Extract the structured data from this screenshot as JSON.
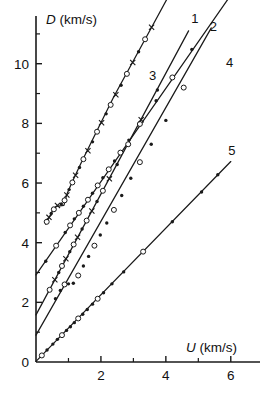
{
  "chart_data": {
    "type": "line",
    "title": "",
    "subtitle": "",
    "xlabel": "U (km/s)",
    "ylabel": "D (km/s)",
    "xlabel_symbol": "U",
    "xlabel_unit": "(km/s)",
    "ylabel_symbol": "D",
    "ylabel_unit": "(km/s)",
    "xlim": [
      0,
      6.9
    ],
    "ylim": [
      0,
      11.6
    ],
    "xticks_major": [
      0,
      2,
      4,
      6
    ],
    "xticks_major_labels": [
      "0",
      "2",
      "4",
      "6"
    ],
    "xticks_minor": [
      1,
      3,
      5
    ],
    "yticks_major": [
      0,
      2,
      4,
      6,
      8,
      10
    ],
    "yticks_major_labels": [
      "0",
      "2",
      "4",
      "6",
      "8",
      "10"
    ],
    "yticks_minor": [
      1,
      3,
      5,
      7,
      9,
      11
    ],
    "grid": false,
    "legend_position": "inline-end-of-curve",
    "marker_styles": [
      "open-circle",
      "filled-circle",
      "cross"
    ],
    "series": [
      {
        "name": "1",
        "label": "1",
        "label_x": 4.78,
        "label_y": 11.35,
        "fit_points": [
          [
            0.3,
            4.62
          ],
          [
            0.42,
            4.88
          ],
          [
            0.52,
            5.1
          ],
          [
            0.62,
            5.22
          ],
          [
            0.86,
            5.25
          ],
          [
            0.95,
            5.62
          ],
          [
            1.1,
            6.0
          ],
          [
            1.4,
            6.7
          ],
          [
            1.9,
            7.8
          ],
          [
            2.4,
            8.9
          ],
          [
            3.0,
            10.1
          ],
          [
            3.6,
            11.3
          ],
          [
            4.3,
            12.7
          ]
        ],
        "data_points": [
          [
            0.33,
            4.7
          ],
          [
            0.4,
            4.85
          ],
          [
            0.47,
            4.98
          ],
          [
            0.55,
            5.12
          ],
          [
            0.66,
            5.25
          ],
          [
            0.78,
            5.3
          ],
          [
            0.88,
            5.42
          ],
          [
            0.95,
            5.6
          ],
          [
            1.02,
            5.78
          ],
          [
            1.12,
            6.02
          ],
          [
            1.22,
            6.26
          ],
          [
            1.34,
            6.52
          ],
          [
            1.46,
            6.8
          ],
          [
            1.6,
            7.08
          ],
          [
            1.74,
            7.38
          ],
          [
            1.88,
            7.72
          ],
          [
            2.02,
            8.02
          ],
          [
            2.16,
            8.32
          ],
          [
            2.3,
            8.62
          ],
          [
            2.46,
            8.96
          ],
          [
            2.62,
            9.28
          ],
          [
            2.8,
            9.66
          ],
          [
            2.98,
            10.04
          ],
          [
            3.16,
            10.4
          ],
          [
            3.36,
            10.82
          ],
          [
            3.56,
            11.22
          ],
          [
            3.78,
            11.62
          ],
          [
            4.02,
            12.1
          ],
          [
            4.32,
            12.68
          ]
        ],
        "has_step": true,
        "step_region_x": [
          0.6,
          0.9
        ],
        "step_region_y": 5.24
      },
      {
        "name": "2",
        "label": "2",
        "label_x": 5.35,
        "label_y": 11.1,
        "fit_points": [
          [
            0.0,
            2.92
          ],
          [
            6.0,
            12.3
          ]
        ],
        "data_points": [
          [
            0.3,
            3.38
          ],
          [
            0.62,
            3.9
          ],
          [
            0.9,
            4.34
          ],
          [
            1.05,
            4.58
          ],
          [
            1.18,
            4.8
          ],
          [
            1.32,
            5.0
          ],
          [
            1.46,
            5.22
          ],
          [
            1.6,
            5.44
          ],
          [
            1.74,
            5.66
          ],
          [
            1.9,
            5.92
          ],
          [
            2.06,
            6.18
          ],
          [
            2.24,
            6.46
          ],
          [
            2.42,
            6.74
          ],
          [
            2.6,
            7.02
          ],
          [
            2.86,
            7.44
          ],
          [
            3.2,
            7.98
          ],
          [
            3.7,
            8.76
          ],
          [
            4.2,
            9.54
          ],
          [
            4.8,
            10.48
          ]
        ],
        "has_step": false
      },
      {
        "name": "3",
        "label": "3",
        "label_x": 3.48,
        "label_y": 9.45,
        "fit_points": [
          [
            0.0,
            1.58
          ],
          [
            4.7,
            11.1
          ]
        ],
        "data_points": [
          [
            0.42,
            2.42
          ],
          [
            0.58,
            2.76
          ],
          [
            0.7,
            3.0
          ],
          [
            0.8,
            3.22
          ],
          [
            0.92,
            3.46
          ],
          [
            1.04,
            3.7
          ],
          [
            1.16,
            3.94
          ],
          [
            1.28,
            4.18
          ],
          [
            1.42,
            4.46
          ],
          [
            1.56,
            4.74
          ],
          [
            1.72,
            5.06
          ],
          [
            1.88,
            5.38
          ],
          [
            2.06,
            5.74
          ],
          [
            2.26,
            6.14
          ],
          [
            2.5,
            6.62
          ],
          [
            2.84,
            7.3
          ],
          [
            3.24,
            8.12
          ],
          [
            3.74,
            9.12
          ]
        ],
        "has_step": false
      },
      {
        "name": "4",
        "label": "4",
        "label_x": 5.85,
        "label_y": 9.9,
        "fit_points": [
          [
            0.0,
            0.9
          ],
          [
            5.4,
            11.2
          ]
        ],
        "data_points": [
          [
            0.6,
            2.12
          ],
          [
            0.75,
            2.4
          ],
          [
            0.88,
            2.6
          ],
          [
            1.0,
            2.62
          ],
          [
            1.15,
            2.64
          ],
          [
            1.3,
            2.9
          ],
          [
            1.46,
            3.22
          ],
          [
            1.62,
            3.54
          ],
          [
            1.8,
            3.9
          ],
          [
            1.98,
            4.26
          ],
          [
            2.18,
            4.66
          ],
          [
            2.4,
            5.1
          ],
          [
            2.64,
            5.58
          ],
          [
            2.92,
            6.16
          ],
          [
            3.2,
            6.7
          ],
          [
            3.55,
            7.3
          ],
          [
            4.0,
            8.1
          ],
          [
            4.55,
            9.2
          ]
        ],
        "has_step": true,
        "step_region_x": [
          0.98,
          1.2
        ],
        "step_region_y": 2.63
      },
      {
        "name": "5",
        "label": "5",
        "label_x": 5.92,
        "label_y": 6.95,
        "fit_points": [
          [
            0.0,
            0.02
          ],
          [
            6.0,
            6.72
          ]
        ],
        "data_points": [
          [
            0.18,
            0.22
          ],
          [
            0.34,
            0.4
          ],
          [
            0.52,
            0.6
          ],
          [
            0.66,
            0.76
          ],
          [
            0.8,
            0.9
          ],
          [
            0.94,
            1.06
          ],
          [
            1.06,
            1.18
          ],
          [
            1.18,
            1.32
          ],
          [
            1.3,
            1.46
          ],
          [
            1.44,
            1.6
          ],
          [
            1.58,
            1.76
          ],
          [
            1.74,
            1.94
          ],
          [
            1.9,
            2.12
          ],
          [
            2.08,
            2.32
          ],
          [
            2.34,
            2.62
          ],
          [
            2.7,
            3.02
          ],
          [
            3.3,
            3.7
          ],
          [
            4.2,
            4.7
          ],
          [
            5.1,
            5.7
          ],
          [
            5.6,
            6.28
          ]
        ],
        "has_step": false
      }
    ]
  },
  "figure": {
    "axis_color": "#1a1a1a",
    "curve_color": "#1a1a1a",
    "background": "#ffffff",
    "marker_open_fill": "#ffffff"
  }
}
